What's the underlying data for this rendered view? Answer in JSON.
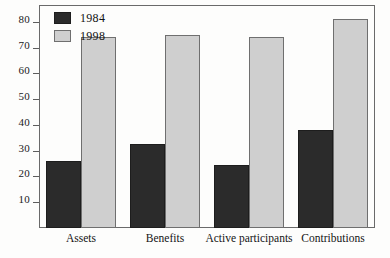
{
  "chart_data": {
    "type": "bar",
    "title": "",
    "xlabel": "",
    "ylabel": "",
    "categories": [
      "Assets",
      "Benefits",
      "Active participants",
      "Contributions"
    ],
    "series": [
      {
        "name": "1984",
        "color": "#2b2b2b",
        "values": [
          26,
          32.5,
          24.5,
          38
        ]
      },
      {
        "name": "1998",
        "color": "#cfcfcf",
        "values": [
          74,
          75,
          74,
          81
        ]
      }
    ],
    "yticks": [
      10,
      20,
      30,
      40,
      50,
      60,
      70,
      80
    ],
    "ytick_labels": [
      "10",
      "20",
      "30",
      "40",
      "50",
      "60",
      "70",
      "80"
    ],
    "ylim": [
      0,
      86.5
    ],
    "grid": false,
    "legend_position": "top-left",
    "frame": true
  },
  "legend": {
    "entries": [
      {
        "label": "1984",
        "swatch": "dark-swatch"
      },
      {
        "label": "1998",
        "swatch": "light-swatch"
      }
    ]
  }
}
